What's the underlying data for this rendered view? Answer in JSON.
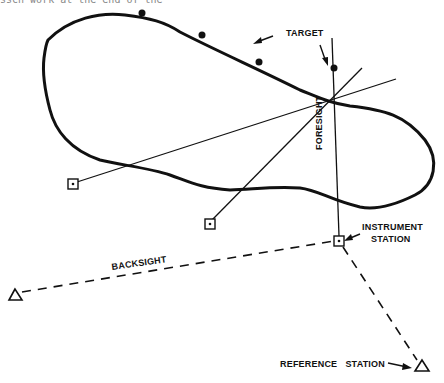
{
  "header": {
    "cut_off_text": "ssch work at the end of the"
  },
  "labels": {
    "target": "TARGET",
    "foresight": "FORESIGHT",
    "instrument_station_line1": "INSTRUMENT",
    "instrument_station_line2": "STATION",
    "backsight": "BACKSIGHT",
    "reference_station": "REFERENCE   STATION"
  },
  "colors": {
    "ink": "#111111",
    "background": "#ffffff"
  },
  "elements": {
    "target_point": {
      "x": 334,
      "y": 68
    },
    "instrument_station": {
      "x": 339,
      "y": 241
    },
    "station_a": {
      "x": 73,
      "y": 184
    },
    "station_b": {
      "x": 210,
      "y": 224
    },
    "backsight_marker": {
      "x": 15,
      "y": 295
    },
    "reference_marker": {
      "x": 422,
      "y": 366
    },
    "dots": [
      {
        "x": 142,
        "y": 13
      },
      {
        "x": 202,
        "y": 35
      },
      {
        "x": 259,
        "y": 62
      }
    ]
  }
}
